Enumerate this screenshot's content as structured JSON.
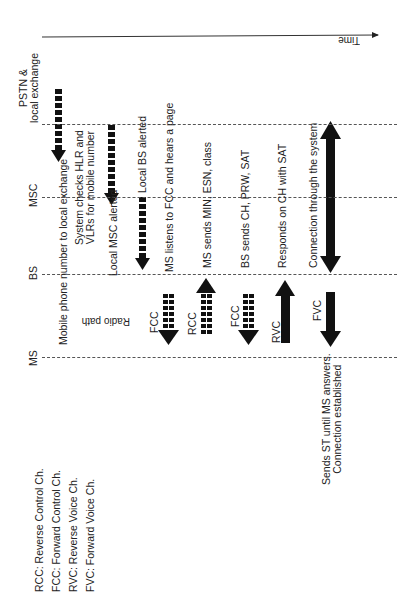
{
  "time_axis": {
    "label": "Time"
  },
  "lanes": [
    {
      "id": "pstn",
      "label": "PSTN & local exchange",
      "line1": "PSTN &",
      "line2": "local exchange"
    },
    {
      "id": "msc",
      "label": "MSC"
    },
    {
      "id": "bs",
      "label": "BS"
    },
    {
      "id": "ms",
      "label": "MS"
    }
  ],
  "radio_path_label": "Radio path",
  "steps": [
    {
      "text": "Mobile phone number to local exchange"
    },
    {
      "line1": "System checks HLR and",
      "line2": "VLRs for mobile number"
    },
    {
      "text": "Local MSC alerted"
    },
    {
      "text": "Local BS alerted"
    },
    {
      "text": "MS listens to FCC and hears a page"
    },
    {
      "text": "MS sends MIN, ESN, class"
    },
    {
      "text": "BS sends CH, PRW, SAT"
    },
    {
      "text": "Responds on CH with SAT"
    },
    {
      "text": "Connection through the system"
    },
    {
      "line1": "Sends ST until MS answers.",
      "line2": "Connection established"
    }
  ],
  "channel_arrows": [
    {
      "label": "FCC",
      "direction": "down",
      "style": "dashed-block"
    },
    {
      "label": "RCC",
      "direction": "up",
      "style": "dashed-block"
    },
    {
      "label": "FCC",
      "direction": "down",
      "style": "dashed-block"
    },
    {
      "label": "RVC",
      "direction": "up",
      "style": "solid"
    },
    {
      "label": "FVC",
      "direction": "down",
      "style": "solid"
    }
  ],
  "legend": [
    "RCC: Reverse Control Ch.",
    "FCC: Forward Control Ch.",
    "RVC: Reverse Voice Ch.",
    "FVC: Forward Voice Ch."
  ]
}
